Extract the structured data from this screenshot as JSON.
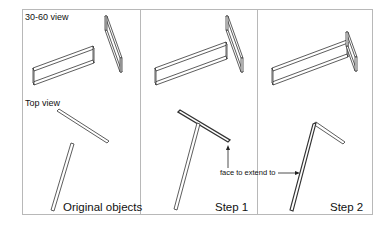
{
  "figure": {
    "panels": [
      {
        "id": "original",
        "caption": "Original objects"
      },
      {
        "id": "step1",
        "caption": "Step 1"
      },
      {
        "id": "step2",
        "caption": "Step 2"
      }
    ],
    "view_labels": {
      "iso": "30-60 view",
      "top": "Top view"
    },
    "annotation": {
      "text": "face to extend to",
      "arrow_glyph": "arrow-right"
    }
  }
}
